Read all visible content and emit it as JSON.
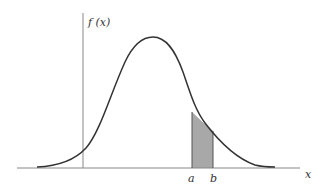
{
  "diagram": {
    "type": "probability-density-curve",
    "y_axis_label": "f (x)",
    "x_axis_label": "x",
    "interval_labels": {
      "a": "a",
      "b": "b"
    },
    "shaded_region": "area under f(x) between a and b",
    "colors": {
      "curve": "#333333",
      "axis": "#888888",
      "shade": "#a8a8a8",
      "bound": "#555555"
    }
  }
}
